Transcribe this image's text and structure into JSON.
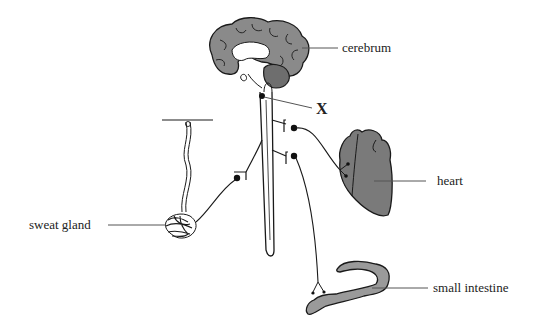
{
  "diagram": {
    "type": "autonomic nervous system (sympathetic pathways)",
    "labels": {
      "cerebrum": "cerebrum",
      "x": "X",
      "heart": "heart",
      "sweat_gland": "sweat gland",
      "small_intestine": "small intestine"
    },
    "colors": {
      "organ_fill": "#8a8a8a",
      "cerebellum_fill": "#6e6e6e",
      "intestine_fill": "#9a9a9a",
      "stroke": "#1a1a1a",
      "leader_line": "#555555"
    }
  }
}
